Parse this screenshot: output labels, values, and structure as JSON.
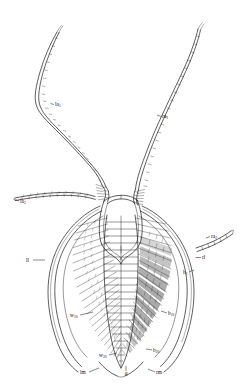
{
  "figure": {
    "kind": "anatomical-line-drawing",
    "background_color": "#ffffff",
    "ink_color": "#1a1a1a",
    "width": 246,
    "height": 390
  },
  "labels": [
    {
      "id": "la2",
      "base": "la",
      "sub": "2",
      "text": "la2",
      "x": 20,
      "y": 203,
      "anchor": "start",
      "leader": "M 19 201 L 14.5 199.5",
      "meaning": "left antenna segment two"
    },
    {
      "id": "la1",
      "base": "la",
      "sub": "1",
      "text": "la1",
      "x": 55,
      "y": 106,
      "anchor": "start",
      "leader": "M 54 104.5 L 50.5 103.5",
      "meaning": "left antenna segment one"
    },
    {
      "id": "ra1",
      "base": "ra",
      "sub": "1",
      "text": "ra1",
      "x": 162,
      "y": 118,
      "anchor": "start",
      "leader": "M 161 116.5 L 157 115",
      "meaning": "right antenna segment one"
    },
    {
      "id": "ra2",
      "base": "ra",
      "sub": "2",
      "text": "ra2",
      "x": 211,
      "y": 238,
      "anchor": "start",
      "leader": "M 210 236.5 L 206 238",
      "meaning": "right antenna segment two"
    },
    {
      "id": "rl",
      "base": "rl",
      "sub": "",
      "text": "rl",
      "x": 202,
      "y": 259,
      "anchor": "start",
      "leader": "M 201 257.5 L 195.5 257.5",
      "meaning": "right lamella"
    },
    {
      "id": "ll",
      "base": "ll",
      "sub": "",
      "text": "ll",
      "x": 26,
      "y": 262,
      "anchor": "start",
      "leader": "M 33 260 L 45 260",
      "meaning": "left lamella"
    },
    {
      "id": "b1",
      "base": "b",
      "sub": "1",
      "text": "b1",
      "x": 183,
      "y": 274,
      "anchor": "start",
      "leader": "M 189 272 L 194 270",
      "meaning": "bristle one"
    },
    {
      "id": "b10",
      "base": "b",
      "sub": "10",
      "text": "b10",
      "x": 168,
      "y": 315,
      "anchor": "start",
      "leader": "M 167 313 L 161 311",
      "meaning": "bristle ten"
    },
    {
      "id": "b20",
      "base": "b",
      "sub": "20",
      "text": "b20",
      "x": 153,
      "y": 352,
      "anchor": "start",
      "leader": "M 152 350 L 146 349",
      "meaning": "bristle twenty"
    },
    {
      "id": "w10",
      "base": "w",
      "sub": "10",
      "text": "w10",
      "x": 70,
      "y": 317,
      "anchor": "start",
      "leader": "M 80 315 L 93 312",
      "meaning": "ventral seta ten"
    },
    {
      "id": "w20",
      "base": "w",
      "sub": "20",
      "text": "w20",
      "x": 99,
      "y": 357,
      "anchor": "start",
      "leader": "M 109 355 L 117 353",
      "meaning": "ventral seta twenty"
    },
    {
      "id": "lm",
      "base": "lm",
      "sub": "",
      "text": "lm",
      "x": 80,
      "y": 374,
      "anchor": "start",
      "leader": "M 89 372 L 99 368",
      "meaning": "left margin"
    },
    {
      "id": "rm",
      "base": "rm",
      "sub": "",
      "text": "rm",
      "x": 156,
      "y": 374,
      "anchor": "start",
      "leader": "M 155 372 L 148 369",
      "meaning": "right margin"
    },
    {
      "id": "q",
      "base": "q",
      "sub": "",
      "text": "q",
      "x": 126,
      "y": 375,
      "anchor": "middle",
      "leader": "M 126 371 L 126 366",
      "meaning": "caudal point"
    }
  ]
}
